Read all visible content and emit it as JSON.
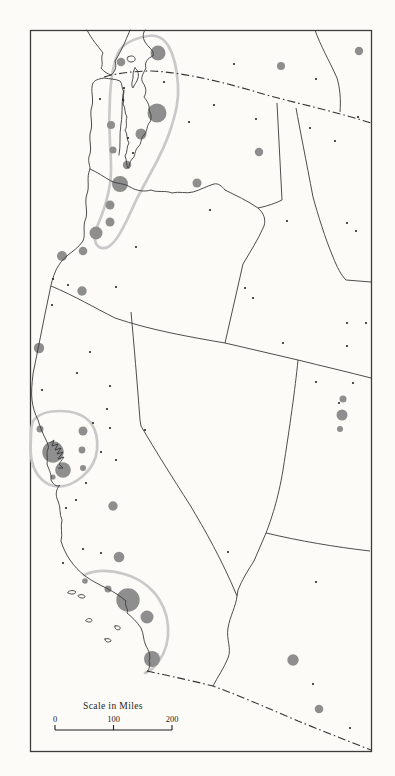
{
  "legend": {
    "title": "Scale in Miles",
    "ticks": [
      "0",
      "100",
      "200"
    ]
  },
  "map": {
    "description": "Far-western North America dot map with proportional gray circles for metropolitan areas and light gray outlines around three urban corridors",
    "colors": {
      "paper": "#fcfbf7",
      "city_circle_gray": "#8e8e8e",
      "corridor_outline_gray": "#c9c9c9",
      "linework": "#3a3a3a",
      "town_dot": "#262626"
    },
    "corridors": [
      {
        "name": "pacific-northwest-corridor"
      },
      {
        "name": "san-francisco-bay-corridor"
      },
      {
        "name": "southern-california-corridor"
      }
    ],
    "international_borders": [
      {
        "name": "canada-border"
      },
      {
        "name": "mexico-border"
      }
    ],
    "city_circles": [
      {
        "x": 158,
        "y": 53,
        "r": 7.5
      },
      {
        "x": 121,
        "y": 62,
        "r": 4.3
      },
      {
        "x": 157,
        "y": 113,
        "r": 9.5
      },
      {
        "x": 141,
        "y": 134,
        "r": 5.5
      },
      {
        "x": 111,
        "y": 125,
        "r": 4.0
      },
      {
        "x": 127,
        "y": 165,
        "r": 4.2
      },
      {
        "x": 113,
        "y": 150,
        "r": 3.5
      },
      {
        "x": 281,
        "y": 66,
        "r": 4.0
      },
      {
        "x": 259,
        "y": 152,
        "r": 4.2
      },
      {
        "x": 197,
        "y": 183,
        "r": 4.5
      },
      {
        "x": 359,
        "y": 51,
        "r": 4.2
      },
      {
        "x": 120,
        "y": 184,
        "r": 8.0
      },
      {
        "x": 110,
        "y": 205,
        "r": 4.5
      },
      {
        "x": 110,
        "y": 222,
        "r": 4.5
      },
      {
        "x": 96,
        "y": 233,
        "r": 6.5
      },
      {
        "x": 62,
        "y": 256,
        "r": 5.0
      },
      {
        "x": 83,
        "y": 251,
        "r": 4.3
      },
      {
        "x": 82,
        "y": 291,
        "r": 4.7
      },
      {
        "x": 39,
        "y": 348,
        "r": 5.2
      },
      {
        "x": 40,
        "y": 429,
        "r": 3.5
      },
      {
        "x": 83,
        "y": 431,
        "r": 4.5
      },
      {
        "x": 53,
        "y": 452,
        "r": 10.7
      },
      {
        "x": 82,
        "y": 450,
        "r": 3.4
      },
      {
        "x": 63,
        "y": 470,
        "r": 7.8
      },
      {
        "x": 83,
        "y": 468,
        "r": 3.0
      },
      {
        "x": 53,
        "y": 477,
        "r": 2.6
      },
      {
        "x": 113,
        "y": 506,
        "r": 4.7
      },
      {
        "x": 119,
        "y": 557,
        "r": 5.3
      },
      {
        "x": 85,
        "y": 581,
        "r": 2.8
      },
      {
        "x": 108,
        "y": 589,
        "r": 3.5
      },
      {
        "x": 128,
        "y": 600,
        "r": 11.7
      },
      {
        "x": 147,
        "y": 617,
        "r": 6.5
      },
      {
        "x": 152,
        "y": 659,
        "r": 8.0
      },
      {
        "x": 343,
        "y": 399,
        "r": 3.5
      },
      {
        "x": 342,
        "y": 415,
        "r": 5.5
      },
      {
        "x": 340,
        "y": 429,
        "r": 3.0
      },
      {
        "x": 293,
        "y": 660,
        "r": 5.7
      },
      {
        "x": 319,
        "y": 709,
        "r": 4.3
      }
    ],
    "town_dots": [
      [
        100,
        99
      ],
      [
        124,
        88
      ],
      [
        123,
        100
      ],
      [
        128,
        138
      ],
      [
        133,
        153
      ],
      [
        164,
        82
      ],
      [
        189,
        122
      ],
      [
        214,
        105
      ],
      [
        234,
        64
      ],
      [
        256,
        119
      ],
      [
        316,
        79
      ],
      [
        310,
        128
      ],
      [
        335,
        141
      ],
      [
        358,
        117
      ],
      [
        136,
        247
      ],
      [
        210,
        210
      ],
      [
        116,
        287
      ],
      [
        245,
        288
      ],
      [
        253,
        298
      ],
      [
        283,
        343
      ],
      [
        287,
        221
      ],
      [
        347,
        223
      ],
      [
        356,
        231
      ],
      [
        347,
        323
      ],
      [
        366,
        323
      ],
      [
        347,
        346
      ],
      [
        316,
        382
      ],
      [
        353,
        383
      ],
      [
        339,
        403
      ],
      [
        53,
        279
      ],
      [
        68,
        285
      ],
      [
        52,
        305
      ],
      [
        90,
        352
      ],
      [
        77,
        373
      ],
      [
        42,
        390
      ],
      [
        110,
        386
      ],
      [
        107,
        409
      ],
      [
        110,
        428
      ],
      [
        145,
        430
      ],
      [
        93,
        423
      ],
      [
        101,
        452
      ],
      [
        116,
        460
      ],
      [
        86,
        483
      ],
      [
        76,
        500
      ],
      [
        66,
        508
      ],
      [
        83,
        549
      ],
      [
        101,
        553
      ],
      [
        63,
        563
      ],
      [
        228,
        552
      ],
      [
        316,
        582
      ],
      [
        313,
        684
      ],
      [
        350,
        728
      ]
    ]
  }
}
